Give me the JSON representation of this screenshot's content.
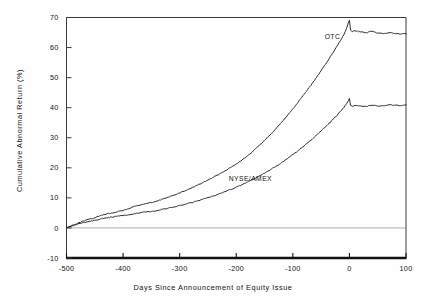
{
  "chart_data": {
    "type": "line",
    "title": "",
    "xlabel": "Days Since Announcement of Equity Issue",
    "ylabel": "Cumulative Abnormal Return (%)",
    "xlim": [
      -500,
      100
    ],
    "ylim": [
      -10,
      70
    ],
    "xticks": [
      -500,
      -400,
      -300,
      -200,
      -100,
      0,
      100
    ],
    "xticklabels": [
      "-500",
      "-400",
      "-300",
      "-200",
      "-100",
      "0",
      "100"
    ],
    "yticks": [
      -10,
      0,
      10,
      20,
      30,
      40,
      50,
      60,
      70
    ],
    "yticklabels": [
      "-10",
      "0",
      "10",
      "20",
      "30",
      "40",
      "50",
      "60",
      "70"
    ],
    "grid": false,
    "legend_position": "inline-annotation",
    "zero_line": true,
    "series": [
      {
        "name": "OTC",
        "label": "OTC",
        "color": "#222222",
        "label_x": -30,
        "label_y": 63,
        "x": [
          -500,
          -490,
          -480,
          -470,
          -460,
          -450,
          -440,
          -430,
          -420,
          -410,
          -400,
          -390,
          -380,
          -370,
          -360,
          -350,
          -340,
          -330,
          -320,
          -310,
          -300,
          -290,
          -280,
          -270,
          -260,
          -250,
          -240,
          -230,
          -220,
          -210,
          -200,
          -190,
          -180,
          -170,
          -160,
          -150,
          -140,
          -130,
          -120,
          -110,
          -100,
          -90,
          -80,
          -70,
          -60,
          -50,
          -40,
          -30,
          -20,
          -10,
          -5,
          -2,
          0,
          2,
          5,
          10,
          20,
          30,
          40,
          50,
          60,
          70,
          80,
          90,
          100
        ],
        "y": [
          0,
          0.9,
          1.6,
          2.3,
          2.9,
          3.4,
          4.1,
          4.6,
          5.0,
          5.4,
          5.8,
          6.4,
          7.2,
          7.6,
          8.1,
          8.4,
          8.9,
          9.6,
          10.3,
          10.9,
          11.6,
          12.4,
          13.2,
          14.1,
          15.0,
          15.9,
          16.9,
          17.9,
          19.0,
          20.1,
          21.3,
          22.6,
          24.0,
          25.6,
          27.3,
          29.1,
          31.0,
          33.0,
          35.1,
          37.3,
          39.6,
          42.0,
          44.5,
          47.0,
          49.6,
          52.3,
          55.1,
          58.0,
          61.0,
          64.2,
          66.4,
          68.2,
          69.1,
          65.8,
          65.3,
          65.6,
          65.2,
          64.9,
          65.4,
          64.8,
          64.6,
          65.0,
          64.7,
          64.5,
          64.6
        ]
      },
      {
        "name": "NYSE/AMEX",
        "label": "NYSE/AMEX",
        "color": "#222222",
        "label_x": -175,
        "label_y": 15.5,
        "x": [
          -500,
          -490,
          -480,
          -470,
          -460,
          -450,
          -440,
          -430,
          -420,
          -410,
          -400,
          -390,
          -380,
          -370,
          -360,
          -350,
          -340,
          -330,
          -320,
          -310,
          -300,
          -290,
          -280,
          -270,
          -260,
          -250,
          -240,
          -230,
          -220,
          -210,
          -200,
          -190,
          -180,
          -170,
          -160,
          -150,
          -140,
          -130,
          -120,
          -110,
          -100,
          -90,
          -80,
          -70,
          -60,
          -50,
          -40,
          -30,
          -20,
          -10,
          -5,
          -2,
          0,
          2,
          5,
          10,
          20,
          30,
          40,
          50,
          60,
          70,
          80,
          90,
          100
        ],
        "y": [
          0,
          0.7,
          1.3,
          1.8,
          2.2,
          2.6,
          3.0,
          3.3,
          3.6,
          3.9,
          4.1,
          4.4,
          4.7,
          5.0,
          5.3,
          5.5,
          5.8,
          6.2,
          6.6,
          7.0,
          7.4,
          7.9,
          8.4,
          8.9,
          9.5,
          10.1,
          10.7,
          11.4,
          12.1,
          12.8,
          13.6,
          14.4,
          15.3,
          16.2,
          17.2,
          18.2,
          19.3,
          20.5,
          21.7,
          23.0,
          24.4,
          25.8,
          27.3,
          28.9,
          30.5,
          32.2,
          34.0,
          35.9,
          37.9,
          40.0,
          41.3,
          42.3,
          43.1,
          40.8,
          40.5,
          40.8,
          40.6,
          40.4,
          40.9,
          40.5,
          40.7,
          41.0,
          40.8,
          40.7,
          41.0
        ]
      }
    ]
  }
}
